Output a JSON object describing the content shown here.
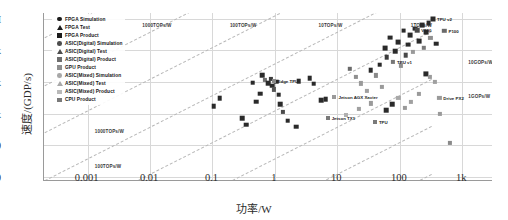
{
  "chart_data": {
    "type": "scatter",
    "title": "",
    "xlabel": "功率/W",
    "ylabel": "速度/(GDP/s)",
    "xscale": "log",
    "yscale": "log",
    "xlim": [
      0.0002,
      3000
    ],
    "ylim": [
      8,
      1500000
    ],
    "grid": true,
    "legend_position": "upper-left-inside",
    "xticks": [
      {
        "value": 0.001,
        "label": "0.001"
      },
      {
        "value": 0.01,
        "label": "0.01"
      },
      {
        "value": 0.1,
        "label": "0.1"
      },
      {
        "value": 1,
        "label": "1"
      },
      {
        "value": 10,
        "label": "10"
      },
      {
        "value": 100,
        "label": "100"
      },
      {
        "value": 1000,
        "label": "1k"
      }
    ],
    "yticks": [
      {
        "value": 10,
        "label": "10"
      },
      {
        "value": 100,
        "label": "100"
      },
      {
        "value": 1000,
        "label": "1k"
      },
      {
        "value": 10000,
        "label": "10k"
      },
      {
        "value": 100000,
        "label": "100k"
      },
      {
        "value": 1000000,
        "label": "1M"
      }
    ],
    "legend": [
      {
        "label": "FPGA Simulation",
        "marker": "circle",
        "color": "#1b1b1b"
      },
      {
        "label": "FPGA Test",
        "marker": "triangle",
        "color": "#1b1b1b"
      },
      {
        "label": "FPGA Product",
        "marker": "square",
        "color": "#1b1b1b"
      },
      {
        "label": "ASIC(Digital) Simulation",
        "marker": "circle",
        "color": "#4d4d4d"
      },
      {
        "label": "ASIC(Digital) Test",
        "marker": "triangle",
        "color": "#4d4d4d"
      },
      {
        "label": "ASIC(Digital) Product",
        "marker": "square",
        "color": "#6e6e6e"
      },
      {
        "label": "GPU Product",
        "marker": "square",
        "color": "#8f8f8f"
      },
      {
        "label": "ASIC(Mixed) Simulation",
        "marker": "circle",
        "color": "#a8a8a8"
      },
      {
        "label": "ASIC(Mixed) Test",
        "marker": "triangle",
        "color": "#a8a8a8"
      },
      {
        "label": "ASIC(Mixed) Product",
        "marker": "square",
        "color": "#b9b9b9"
      },
      {
        "label": "CPU Product",
        "marker": "square",
        "color": "#7a7a7a"
      }
    ],
    "iso_lines": [
      {
        "label": "1000TOPs/W",
        "label_x": 0.0075,
        "label_y": 700000
      },
      {
        "label": "100TOPs/W",
        "label_x": 0.19,
        "label_y": 700000
      },
      {
        "label": "10TOPs/W",
        "label_x": 5.0,
        "label_y": 700000
      },
      {
        "label": "1TOPs/W",
        "label_x": 150,
        "label_y": 700000
      },
      {
        "label": "10GOPs/W",
        "label_x": 1250,
        "label_y": 48000
      },
      {
        "label": "1GOPs/W",
        "label_x": 1250,
        "label_y": 4200
      },
      {
        "label": "1000TOPs/W",
        "label_x": 0.0013,
        "label_y": 320
      },
      {
        "label": "100TOPs/W",
        "label_x": 0.0013,
        "label_y": 26
      }
    ],
    "annotations": [
      {
        "text": "Edge TPU",
        "x": 0.95,
        "y": 11000
      },
      {
        "text": "Jetson AGX Xavier",
        "x": 9.0,
        "y": 3300
      },
      {
        "text": "Jetson TX1",
        "x": 7.0,
        "y": 700
      },
      {
        "text": "TPU",
        "x": 40.0,
        "y": 560
      },
      {
        "text": "TPU v1",
        "x": 78.0,
        "y": 42000
      },
      {
        "text": "Drive PX2",
        "x": 430,
        "y": 3100
      },
      {
        "text": "TPU v2",
        "x": 340,
        "y": 980000
      },
      {
        "text": "V100",
        "x": 190,
        "y": 430000
      },
      {
        "text": "P100",
        "x": 520,
        "y": 420000
      }
    ],
    "points": [
      {
        "x": 0.62,
        "y": 16000,
        "marker": "square",
        "color": "#2a2a2a",
        "size": 4.6
      },
      {
        "x": 0.7,
        "y": 11500,
        "marker": "square",
        "color": "#6e6e6e",
        "size": 4.2
      },
      {
        "x": 0.78,
        "y": 9000,
        "marker": "square",
        "color": "#2a2a2a",
        "size": 4.6
      },
      {
        "x": 0.86,
        "y": 12500,
        "marker": "square",
        "color": "#3a3a3a",
        "size": 4.2
      },
      {
        "x": 0.9,
        "y": 7600,
        "marker": "square",
        "color": "#2a2a2a",
        "size": 4.6
      },
      {
        "x": 0.97,
        "y": 5800,
        "marker": "square",
        "color": "#555555",
        "size": 4.2
      },
      {
        "x": 1.05,
        "y": 10200,
        "marker": "square",
        "color": "#2a2a2a",
        "size": 4.6
      },
      {
        "x": 1.15,
        "y": 3900,
        "marker": "square",
        "color": "#2a2a2a",
        "size": 4.6
      },
      {
        "x": 1.22,
        "y": 2000,
        "marker": "square",
        "color": "#2a2a2a",
        "size": 4.6
      },
      {
        "x": 1.35,
        "y": 1150,
        "marker": "square",
        "color": "#4a4a4a",
        "size": 4.2
      },
      {
        "x": 0.58,
        "y": 4300,
        "marker": "square",
        "color": "#2a2a2a",
        "size": 4.6
      },
      {
        "x": 0.5,
        "y": 2400,
        "marker": "square",
        "color": "#2a2a2a",
        "size": 4.6
      },
      {
        "x": 0.44,
        "y": 9500,
        "marker": "square",
        "color": "#2a2a2a",
        "size": 4.6
      },
      {
        "x": 2.4,
        "y": 10500,
        "marker": "square",
        "color": "#2a2a2a",
        "size": 4.6
      },
      {
        "x": 3.6,
        "y": 13000,
        "marker": "square",
        "color": "#2a2a2a",
        "size": 4.6
      },
      {
        "x": 4.2,
        "y": 8800,
        "marker": "square",
        "color": "#2a2a2a",
        "size": 4.6
      },
      {
        "x": 5.5,
        "y": 2600,
        "marker": "square",
        "color": "#2a2a2a",
        "size": 4.6
      },
      {
        "x": 6.5,
        "y": 2800,
        "marker": "square",
        "color": "#2a2a2a",
        "size": 4.6
      },
      {
        "x": 0.95,
        "y": 11000,
        "marker": "square",
        "color": "#8a8a8a",
        "size": 4.0
      },
      {
        "x": 9.0,
        "y": 3300,
        "marker": "square",
        "color": "#9a9a9a",
        "size": 4.0
      },
      {
        "x": 7.0,
        "y": 700,
        "marker": "square",
        "color": "#7a7a7a",
        "size": 4.0
      },
      {
        "x": 40.0,
        "y": 560,
        "marker": "square",
        "color": "#7a7a7a",
        "size": 4.0
      },
      {
        "x": 16,
        "y": 26000,
        "marker": "square",
        "color": "#6a6a6a",
        "size": 4.4
      },
      {
        "x": 20,
        "y": 14000,
        "marker": "square",
        "color": "#8f8f8f",
        "size": 4.2
      },
      {
        "x": 24,
        "y": 9000,
        "marker": "square",
        "color": "#9a9a9a",
        "size": 4.2
      },
      {
        "x": 30,
        "y": 5200,
        "marker": "square",
        "color": "#a0a0a0",
        "size": 4.2
      },
      {
        "x": 34,
        "y": 23000,
        "marker": "square",
        "color": "#2a2a2a",
        "size": 4.6
      },
      {
        "x": 42,
        "y": 16000,
        "marker": "square",
        "color": "#8a8a8a",
        "size": 4.2
      },
      {
        "x": 48,
        "y": 35000,
        "marker": "square",
        "color": "#2a2a2a",
        "size": 4.6
      },
      {
        "x": 52,
        "y": 7000,
        "marker": "square",
        "color": "#9a9a9a",
        "size": 4.2
      },
      {
        "x": 58,
        "y": 120000,
        "marker": "square",
        "color": "#2a2a2a",
        "size": 4.8
      },
      {
        "x": 62,
        "y": 60000,
        "marker": "square",
        "color": "#3a3a3a",
        "size": 4.6
      },
      {
        "x": 70,
        "y": 250000,
        "marker": "square",
        "color": "#2a2a2a",
        "size": 4.8
      },
      {
        "x": 78,
        "y": 42000,
        "marker": "square",
        "color": "#777777",
        "size": 4.2
      },
      {
        "x": 85,
        "y": 95000,
        "marker": "square",
        "color": "#2a2a2a",
        "size": 4.6
      },
      {
        "x": 95,
        "y": 180000,
        "marker": "square",
        "color": "#2a2a2a",
        "size": 4.8
      },
      {
        "x": 105,
        "y": 33000,
        "marker": "square",
        "color": "#8f8f8f",
        "size": 4.2
      },
      {
        "x": 115,
        "y": 420000,
        "marker": "square",
        "color": "#2a2a2a",
        "size": 4.8
      },
      {
        "x": 125,
        "y": 70000,
        "marker": "square",
        "color": "#4a4a4a",
        "size": 4.6
      },
      {
        "x": 135,
        "y": 150000,
        "marker": "square",
        "color": "#2a2a2a",
        "size": 4.8
      },
      {
        "x": 145,
        "y": 300000,
        "marker": "square",
        "color": "#2a2a2a",
        "size": 4.8
      },
      {
        "x": 160,
        "y": 90000,
        "marker": "square",
        "color": "#9a9a9a",
        "size": 4.2
      },
      {
        "x": 175,
        "y": 480000,
        "marker": "square",
        "color": "#2a2a2a",
        "size": 4.8
      },
      {
        "x": 190,
        "y": 430000,
        "marker": "square",
        "color": "#4a4a4a",
        "size": 4.6
      },
      {
        "x": 205,
        "y": 200000,
        "marker": "square",
        "color": "#2a2a2a",
        "size": 4.8
      },
      {
        "x": 225,
        "y": 620000,
        "marker": "square",
        "color": "#2a2a2a",
        "size": 4.8
      },
      {
        "x": 245,
        "y": 120000,
        "marker": "square",
        "color": "#7a7a7a",
        "size": 4.4
      },
      {
        "x": 265,
        "y": 380000,
        "marker": "square",
        "color": "#2a2a2a",
        "size": 4.8
      },
      {
        "x": 290,
        "y": 700000,
        "marker": "square",
        "color": "#2a2a2a",
        "size": 4.8
      },
      {
        "x": 340,
        "y": 980000,
        "marker": "square",
        "color": "#2a2a2a",
        "size": 5.0
      },
      {
        "x": 310,
        "y": 250000,
        "marker": "square",
        "color": "#8f8f8f",
        "size": 4.2
      },
      {
        "x": 380,
        "y": 160000,
        "marker": "square",
        "color": "#2a2a2a",
        "size": 4.6
      },
      {
        "x": 430,
        "y": 3100,
        "marker": "square",
        "color": "#9a9a9a",
        "size": 4.2
      },
      {
        "x": 520,
        "y": 420000,
        "marker": "square",
        "color": "#6a6a6a",
        "size": 4.4
      },
      {
        "x": 260,
        "y": 18000,
        "marker": "square",
        "color": "#2a2a2a",
        "size": 5.2
      },
      {
        "x": 300,
        "y": 14000,
        "marker": "square",
        "color": "#9a9a9a",
        "size": 4.2
      },
      {
        "x": 360,
        "y": 10000,
        "marker": "square",
        "color": "#a0a0a0",
        "size": 4.2
      },
      {
        "x": 200,
        "y": 4200,
        "marker": "square",
        "color": "#9a9a9a",
        "size": 4.2
      },
      {
        "x": 150,
        "y": 2400,
        "marker": "square",
        "color": "#a0a0a0",
        "size": 4.2
      },
      {
        "x": 120,
        "y": 1500,
        "marker": "square",
        "color": "#9a9a9a",
        "size": 4.2
      },
      {
        "x": 95,
        "y": 3200,
        "marker": "square",
        "color": "#a8a8a8",
        "size": 4.2
      },
      {
        "x": 75,
        "y": 2000,
        "marker": "square",
        "color": "#2a2a2a",
        "size": 4.6
      },
      {
        "x": 60,
        "y": 1300,
        "marker": "square",
        "color": "#2a2a2a",
        "size": 4.6
      },
      {
        "x": 34,
        "y": 2100,
        "marker": "square",
        "color": "#9a9a9a",
        "size": 4.2
      },
      {
        "x": 22,
        "y": 1400,
        "marker": "square",
        "color": "#a0a0a0",
        "size": 4.2
      },
      {
        "x": 14,
        "y": 900,
        "marker": "square",
        "color": "#b0b0b0",
        "size": 4.0
      },
      {
        "x": 0.3,
        "y": 700,
        "marker": "square",
        "color": "#2a2a2a",
        "size": 4.6
      },
      {
        "x": 0.35,
        "y": 450,
        "marker": "square",
        "color": "#2a2a2a",
        "size": 4.6
      },
      {
        "x": 1.6,
        "y": 600,
        "marker": "square",
        "color": "#2a2a2a",
        "size": 4.6
      },
      {
        "x": 2.2,
        "y": 380,
        "marker": "square",
        "color": "#2a2a2a",
        "size": 4.6
      },
      {
        "x": 440,
        "y": 1000,
        "marker": "square",
        "color": "#9a9a9a",
        "size": 4.2
      },
      {
        "x": 640,
        "y": 120,
        "marker": "square",
        "color": "#8a8a8a",
        "size": 4.2
      },
      {
        "x": 0.13,
        "y": 3100,
        "marker": "square",
        "color": "#2a2a2a",
        "size": 4.6
      },
      {
        "x": 0.105,
        "y": 1700,
        "marker": "square",
        "color": "#2a2a2a",
        "size": 4.6
      }
    ]
  }
}
